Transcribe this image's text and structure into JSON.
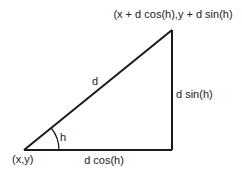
{
  "diagram": {
    "title": "",
    "colors": {
      "line": "#1a1a1a",
      "text": "#222222",
      "background": "#ffffff"
    },
    "vertices": {
      "origin": {
        "label": "(x,y)"
      },
      "top": {
        "label": "(x + d cos(h),y + d sin(h)"
      }
    },
    "edges": {
      "hypotenuse": {
        "label": "d"
      },
      "vertical": {
        "label": "d sin(h)"
      },
      "horizontal": {
        "label": "d cos(h)"
      }
    },
    "angle": {
      "label": "h"
    }
  }
}
